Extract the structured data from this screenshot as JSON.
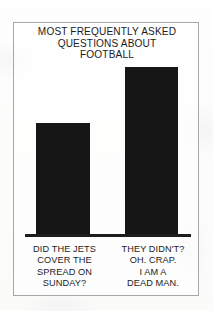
{
  "chart_data": {
    "type": "bar",
    "title": "MOST FREQUENTLY ASKED QUESTIONS ABOUT FOOTBALL",
    "title_lines": [
      "MOST FREQUENTLY ASKED",
      "QUESTIONS ABOUT",
      "FOOTBALL"
    ],
    "categories": [
      "DID THE JETS COVER THE SPREAD ON SUNDAY?",
      "THEY DIDN'T? OH. CRAP. I AM A DEAD MAN."
    ],
    "category_lines": [
      [
        "DID THE JETS",
        "COVER THE",
        "SPREAD ON",
        "SUNDAY?"
      ],
      [
        "THEY DIDN'T?",
        "OH. CRAP.",
        "I AM A",
        "DEAD MAN."
      ]
    ],
    "values": [
      111,
      167
    ],
    "ylim": [
      0,
      190
    ],
    "xlabel": "",
    "ylabel": "",
    "grid": false,
    "legend": false,
    "bar_color": "#161616",
    "axis_color": "#1d1d1d",
    "background_color": "#fdfdfc",
    "frame_color": "#a8a8ac"
  }
}
